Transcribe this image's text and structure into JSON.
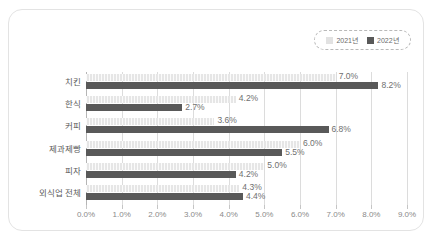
{
  "chart_data": {
    "type": "bar",
    "orientation": "horizontal",
    "title": "",
    "subtitle": "",
    "xlabel": "",
    "ylabel": "",
    "categories": [
      "치킨",
      "한식",
      "커피",
      "제과제빵",
      "피자",
      "외식업 전체"
    ],
    "series": [
      {
        "name": "2021년",
        "color": "#e6e6e6",
        "values": [
          7.0,
          4.2,
          3.6,
          6.0,
          5.0,
          4.3
        ],
        "labels": [
          "7.0%",
          "4.2%",
          "3.6%",
          "6.0%",
          "5.0%",
          "4.3%"
        ]
      },
      {
        "name": "2022년",
        "color": "#595959",
        "values": [
          8.2,
          2.7,
          6.8,
          5.5,
          4.2,
          4.4
        ],
        "labels": [
          "8.2%",
          "2.7%",
          "6.8%",
          "5.5%",
          "4.2%",
          "4.4%"
        ]
      }
    ],
    "xlim": [
      0.0,
      9.0
    ],
    "xticks": [
      0.0,
      1.0,
      2.0,
      3.0,
      4.0,
      5.0,
      6.0,
      7.0,
      8.0,
      9.0
    ],
    "xtick_labels": [
      "0.0%",
      "1.0%",
      "2.0%",
      "3.0%",
      "4.0%",
      "5.0%",
      "6.0%",
      "7.0%",
      "8.0%",
      "9.0%"
    ],
    "grid": true,
    "grid_axis": "x",
    "legend_position": "top-right"
  },
  "legend": {
    "items": [
      {
        "label": "2021년",
        "swatch": "legend-swatch-2021"
      },
      {
        "label": "2022년",
        "swatch": "legend-swatch-2022"
      }
    ]
  },
  "colors": {
    "series_2021": "#e6e6e6",
    "series_2022": "#595959",
    "grid": "#dcdcdc",
    "axis": "#b5b5b5",
    "card_border": "#e3e3e3",
    "text": "#6f6f6f"
  }
}
